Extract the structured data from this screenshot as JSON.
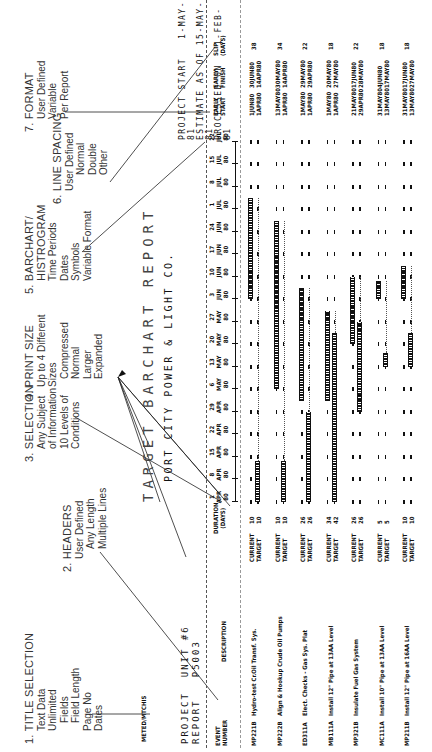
{
  "page_marker": "94",
  "callouts": [
    {
      "num": "1.",
      "title": "TITLE SELECTION",
      "lines": [
        "Text Data",
        "Unlimited",
        "  Fields",
        "  Field Length",
        "Page No",
        "Dates"
      ]
    },
    {
      "num": "2.",
      "title": "HEADERS",
      "lines": [
        "User Defined",
        "  Any Length",
        "  Multiple Lines"
      ]
    },
    {
      "num": "3.",
      "title": "SELECTION",
      "lines": [
        "Any Subject",
        "of Information",
        "10 Levels of",
        "Conditions"
      ]
    },
    {
      "num": "4.",
      "title": "PRINT SIZE",
      "lines": [
        "Up to 4 Different",
        "Sizes",
        "  Compressed",
        "  Normal",
        "  Larger",
        "  Expanded"
      ]
    },
    {
      "num": "5.",
      "title": "BARCHART/",
      "lines": [
        "HISTROGRAM",
        "Time Periods",
        "Dates",
        "Symbols",
        "Variable Format"
      ]
    },
    {
      "num": "6.",
      "title": "LINE SPACING",
      "lines": [
        "User Defined",
        "  Normal",
        "  Double",
        "  Other"
      ]
    },
    {
      "num": "7.",
      "title": "FORMAT",
      "lines": [
        "User Defined",
        "Variable",
        "Per Report"
      ]
    }
  ],
  "report": {
    "date_stamp": "METED/MTCHIS",
    "project_label": "PROJECT",
    "project_value": "UNIT #6",
    "report_label": "REPORT",
    "report_value": "P5003",
    "title": "TARGET BARCHART REPORT",
    "company": "PORT CITY POWER & LIGHT CO.",
    "project_start_label": "PROJECT START",
    "project_start_value": "1-MAY-81",
    "estimate_label": "ESTIMATE AS OF",
    "estimate_value": "15-MAY-81",
    "processed_label": "PROCESSED ON",
    "processed_value": "1-FEB-81",
    "columns": {
      "event": "EVENT",
      "number": "NUMBER",
      "description": "DESCRIPTION",
      "duration": "DURATION",
      "days": "(DAYS)",
      "early_start": "EARLY START",
      "early_finish": "EARLY FINISH",
      "slip": "SLIP (DAYS)"
    },
    "timeline": [
      {
        "day": "1",
        "mon": "APR",
        "yr": "80"
      },
      {
        "day": "8",
        "mon": "APR",
        "yr": "80"
      },
      {
        "day": "15",
        "mon": "APR",
        "yr": "80"
      },
      {
        "day": "22",
        "mon": "APR",
        "yr": "80"
      },
      {
        "day": "29",
        "mon": "APR",
        "yr": "80"
      },
      {
        "day": "6",
        "mon": "MAY",
        "yr": "80"
      },
      {
        "day": "13",
        "mon": "MAY",
        "yr": "80"
      },
      {
        "day": "20",
        "mon": "MAY",
        "yr": "80"
      },
      {
        "day": "27",
        "mon": "MAY",
        "yr": "80"
      },
      {
        "day": "3",
        "mon": "JUN",
        "yr": "80"
      },
      {
        "day": "10",
        "mon": "JUN",
        "yr": "80"
      },
      {
        "day": "17",
        "mon": "JUN",
        "yr": "80"
      },
      {
        "day": "24",
        "mon": "JUN",
        "yr": "80"
      },
      {
        "day": "1",
        "mon": "JUL",
        "yr": "80"
      },
      {
        "day": "8",
        "mon": "JUL",
        "yr": "80"
      },
      {
        "day": "15",
        "mon": "JUL",
        "yr": "80"
      },
      {
        "day": "22",
        "mon": "JUL",
        "yr": "80"
      }
    ],
    "events": [
      {
        "number": "MP221B",
        "description": "Hydro-test Cr.Oil Transf. Sys.",
        "cur_label": "CURRENT",
        "tgt_label": "TARGET",
        "cur_dur": "10",
        "tgt_dur": "10",
        "cur_es": "1JUN80",
        "cur_ef": "30JUN80",
        "tgt_es": "1APR80",
        "tgt_ef": "14APR80",
        "slip": "38"
      },
      {
        "number": "MP222B",
        "description": "Align & Hookup Crude Oil Pumps",
        "cur_label": "CURRENT",
        "tgt_label": "TARGET",
        "cur_dur": "10",
        "tgt_dur": "10",
        "cur_es": "13MAY80",
        "cur_ef": "30MAY80",
        "tgt_es": "1APR80",
        "tgt_ef": "14APR80",
        "slip": "34"
      },
      {
        "number": "ED311A",
        "description": "Elect. Checks - Gas Sys. Plat",
        "cur_label": "CURRENT",
        "tgt_label": "TARGET",
        "cur_dur": "26",
        "tgt_dur": "26",
        "cur_es": "1MAY80",
        "cur_ef": "29MAY80",
        "tgt_es": "1APR80",
        "tgt_ef": "29APR80",
        "slip": "22"
      },
      {
        "number": "MB111A",
        "description": "Install 12\" Pipe at 13AA Level",
        "cur_label": "CURRENT",
        "tgt_label": "TARGET",
        "cur_dur": "34",
        "tgt_dur": "42",
        "cur_es": "1MAY80",
        "cur_ef": "20MAY80",
        "tgt_es": "1APR80",
        "tgt_ef": "27MAY80",
        "slip": "18"
      },
      {
        "number": "MP321B",
        "description": "Insulate Fuel Gas System",
        "cur_label": "CURRENT",
        "tgt_label": "TARGET",
        "cur_dur": "26",
        "tgt_dur": "26",
        "cur_es": "21MAY80",
        "cur_ef": "17JUN80",
        "tgt_es": "29APR80",
        "tgt_ef": "28MAY80",
        "slip": "22"
      },
      {
        "number": "MC111A",
        "description": "Install 10\" Pipe at 13AA Level",
        "cur_label": "CURRENT",
        "tgt_label": "TARGET",
        "cur_dur": "5",
        "tgt_dur": "5",
        "cur_es": "31MAY80",
        "cur_ef": "4JUN80",
        "tgt_es": "13MAY80",
        "tgt_ef": "17MAY80",
        "slip": "18"
      },
      {
        "number": "MP211B",
        "description": "Install 12\" Pipe at 16AA Level",
        "cur_label": "CURRENT",
        "tgt_label": "TARGET",
        "cur_dur": "10",
        "tgt_dur": "10",
        "cur_es": "31MAY80",
        "cur_ef": "17JUN80",
        "tgt_es": "13MAY80",
        "tgt_ef": "27MAY80",
        "slip": "18"
      }
    ]
  },
  "chart_data": {
    "type": "table",
    "title": "TARGET BARCHART REPORT",
    "subtitle": "PORT CITY POWER & LIGHT CO.",
    "columns": [
      "EVENT NUMBER",
      "DESCRIPTION",
      "",
      "DURATION (DAYS)",
      "EARLY START",
      "EARLY FINISH",
      "SLIP (DAYS)"
    ],
    "rows": [
      [
        "MP221B",
        "Hydro-test Cr.Oil Transf. Sys.",
        "CURRENT/TARGET",
        "10/10",
        "1JUN80/1APR80",
        "30JUN80/14APR80",
        "38"
      ],
      [
        "MP222B",
        "Align & Hookup Crude Oil Pumps",
        "CURRENT/TARGET",
        "10/10",
        "13MAY80/1APR80",
        "30MAY80/14APR80",
        "34"
      ],
      [
        "ED311A",
        "Elect. Checks - Gas Sys. Plat",
        "CURRENT/TARGET",
        "26/26",
        "1MAY80/1APR80",
        "29MAY80/29APR80",
        "22"
      ],
      [
        "MB111A",
        "Install 12\" Pipe at 13AA Level",
        "CURRENT/TARGET",
        "34/42",
        "1MAY80/1APR80",
        "20MAY80/27MAY80",
        "18"
      ],
      [
        "MP321B",
        "Insulate Fuel Gas System",
        "CURRENT/TARGET",
        "26/26",
        "21MAY80/29APR80",
        "17JUN80/28MAY80",
        "22"
      ],
      [
        "MC111A",
        "Install 10\" Pipe at 13AA Level",
        "CURRENT/TARGET",
        "5/5",
        "31MAY80/13MAY80",
        "4JUN80/17MAY80",
        "18"
      ],
      [
        "MP211B",
        "Install 12\" Pipe at 16AA Level",
        "CURRENT/TARGET",
        "10/10",
        "31MAY80/13MAY80",
        "17JUN80/27MAY80",
        "18"
      ]
    ]
  }
}
